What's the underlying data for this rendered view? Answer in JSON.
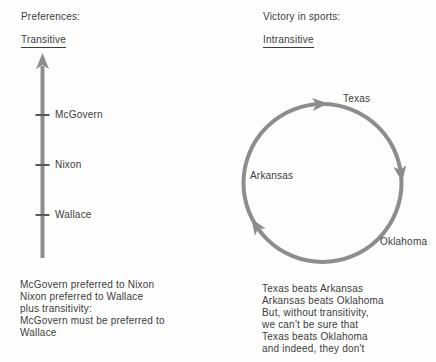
{
  "figure": {
    "left": {
      "heading": "Preferences:",
      "subheading": "Transitive",
      "items": [
        "McGovern",
        "Nixon",
        "Wallace"
      ],
      "caption": [
        "McGovern preferred to Nixon",
        "Nixon preferred to Wallace",
        "plus transitivity:",
        "McGovern must be preferred to",
        "Wallace"
      ]
    },
    "right": {
      "heading": "Victory in sports:",
      "subheading": "Intransitive",
      "items": [
        "Texas",
        "Arkansas",
        "Oklahoma"
      ],
      "caption": [
        "Texas beats Arkansas",
        "Arkansas beats Oklahoma",
        "But, without transitivity,",
        "we can't be sure that",
        "Texas beats Oklahoma",
        "and indeed, they don't"
      ]
    },
    "colors": {
      "diagram_stroke": "#8d8d8d",
      "tick_stroke": "#595959",
      "text": "#3c3c3c",
      "background": "#fdfdfd"
    }
  }
}
